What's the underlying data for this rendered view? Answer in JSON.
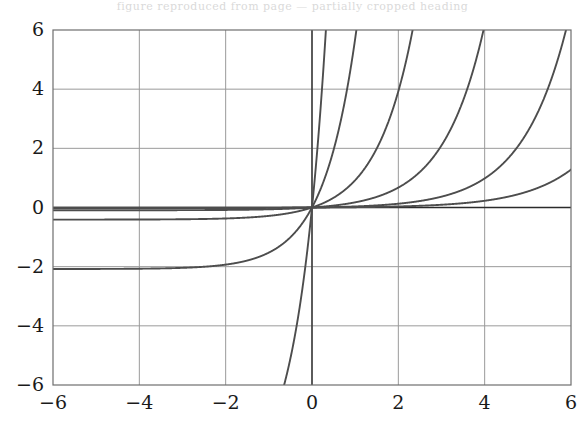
{
  "caption": {
    "ghost_text": "figure reproduced from page — partially cropped heading"
  },
  "colors": {
    "curve": "#4d4d4d",
    "axis": "#2b2b2b",
    "frame": "#6e6e6e",
    "grid": "#9a9a9a",
    "grid_minor": "#c8c8c8",
    "tick_text": "#1a1a1a",
    "background": "#ffffff"
  },
  "geometry": {
    "plot_left": 53,
    "plot_top": 30,
    "plot_right": 571,
    "plot_bottom": 385
  },
  "chart_data": {
    "type": "line",
    "title": "",
    "xlabel": "",
    "ylabel": "",
    "xlim": [
      -6,
      6
    ],
    "ylim": [
      -6,
      6
    ],
    "xticks": [
      -6,
      -4,
      -2,
      0,
      2,
      4,
      6
    ],
    "yticks": [
      -6,
      -4,
      -2,
      0,
      2,
      4,
      6
    ],
    "xtick_labels": [
      "−6",
      "−4",
      "−2",
      "0",
      "2",
      "4",
      "6"
    ],
    "ytick_labels": [
      "−6",
      "−4",
      "−2",
      "0",
      "2",
      "4",
      "6"
    ],
    "grid": true,
    "grid_at_ticks": true,
    "legend": "none",
    "series_count": 6,
    "series_note": "family of odd exponential-type curves, all passing through the origin (0,0)",
    "series": [
      {
        "name": "curve-1",
        "shift": -4.55,
        "amplitude": 0.0105,
        "rate": 1.5,
        "top_cross_x": -3.45,
        "bottom_cross_x": -3.45,
        "left_edge_y": -0.36,
        "right_edge_y": 6.0
      },
      {
        "name": "curve-2",
        "shift": -3.25,
        "amplitude": 0.0285,
        "rate": 1.32,
        "top_cross_x": -1.95,
        "bottom_cross_x": -1.95,
        "left_edge_y": -0.22,
        "right_edge_y": 6.0
      },
      {
        "name": "curve-3",
        "shift": -1.6,
        "amplitude": 0.062,
        "rate": 1.18,
        "top_cross_x": -0.15,
        "bottom_cross_x": -0.15,
        "left_edge_y": -0.13,
        "right_edge_y": 6.0
      },
      {
        "name": "curve-4",
        "shift": 0.15,
        "amplitude": 0.11,
        "rate": 1.05,
        "top_cross_x": 1.7,
        "bottom_cross_x": 1.7,
        "left_edge_y": -0.07,
        "right_edge_y": 6.0
      },
      {
        "name": "curve-5",
        "shift": 2.3,
        "amplitude": 0.2,
        "rate": 0.95,
        "top_cross_x": 4.05,
        "bottom_cross_x": 4.05,
        "left_edge_y": -0.03,
        "right_edge_y": 6.0
      },
      {
        "name": "curve-6",
        "shift": 4.5,
        "amplitude": 0.36,
        "rate": 0.85,
        "top_cross_x": 6.0,
        "bottom_cross_x": 6.0,
        "left_edge_y": -0.01,
        "right_edge_y": 4.0
      }
    ]
  }
}
